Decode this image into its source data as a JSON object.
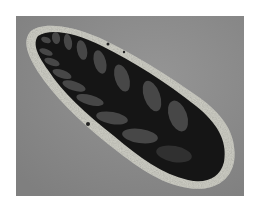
{
  "image": {
    "subject": "microfossil-thin-section",
    "description": "Grayscale photomicrograph of an elongated fossil with a speckled light wall and dark interior with paired chambers",
    "colors": {
      "page_background": "#ffffff",
      "photo_background": "#8b8b8b",
      "wall": "#c8c8c0",
      "interior": "#141414",
      "chambers": "#4a4a4a"
    }
  }
}
